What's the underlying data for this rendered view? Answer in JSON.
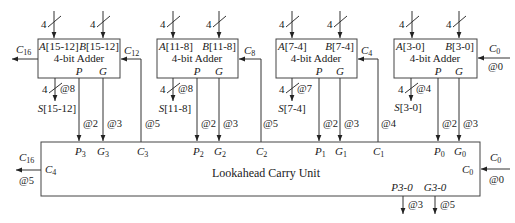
{
  "adders": [
    {
      "a": "A",
      "a_bits": "[15-12]",
      "b": "B",
      "b_bits": "[15-12]",
      "a_width": "4",
      "b_width": "4",
      "title": "4-bit Adder",
      "p": "P",
      "g": "G",
      "sum": "S",
      "sum_bits": "[15-12]",
      "sum_width": "4",
      "sum_delay": "@8",
      "cin": "C",
      "cin_sub": "12",
      "p_delay": "@2",
      "g_delay": "@3",
      "cin_delay": "@5",
      "cout": "C",
      "cout_sub": "16"
    },
    {
      "a": "A",
      "a_bits": "[11-8]",
      "b": "B",
      "b_bits": "[11-8]",
      "a_width": "4",
      "b_width": "4",
      "title": "4-bit Adder",
      "p": "P",
      "g": "G",
      "sum": "S",
      "sum_bits": "[11-8]",
      "sum_width": "4",
      "sum_delay": "@8",
      "cin": "C",
      "cin_sub": "8",
      "p_delay": "@2",
      "g_delay": "@3",
      "cin_delay": "@5"
    },
    {
      "a": "A",
      "a_bits": "[7-4]",
      "b": "B",
      "b_bits": "[7-4]",
      "a_width": "4",
      "b_width": "4",
      "title": "4-bit Adder",
      "p": "P",
      "g": "G",
      "sum": "S",
      "sum_bits": "[7-4]",
      "sum_width": "4",
      "sum_delay": "@7",
      "cin": "C",
      "cin_sub": "4",
      "p_delay": "@2",
      "g_delay": "@3",
      "cin_delay": "@4"
    },
    {
      "a": "A",
      "a_bits": "[3-0]",
      "b": "B",
      "b_bits": "[3-0]",
      "a_width": "4",
      "b_width": "4",
      "title": "4-bit Adder",
      "p": "P",
      "g": "G",
      "sum": "S",
      "sum_bits": "[3-0]",
      "sum_width": "4",
      "sum_delay": "@4",
      "cin": "C",
      "cin_sub": "0",
      "p_delay": "@2",
      "g_delay": "@3",
      "cin_delay": "@0"
    }
  ],
  "lookahead": {
    "title": "Lookahead Carry Unit",
    "ports": [
      {
        "p": "P",
        "p_sub": "3",
        "g": "G",
        "g_sub": "3",
        "c": "C",
        "c_sub": "3"
      },
      {
        "p": "P",
        "p_sub": "2",
        "g": "G",
        "g_sub": "2",
        "c": "C",
        "c_sub": "2"
      },
      {
        "p": "P",
        "p_sub": "1",
        "g": "G",
        "g_sub": "1",
        "c": "C",
        "c_sub": "1"
      },
      {
        "p": "P",
        "p_sub": "0",
        "g": "G",
        "g_sub": "0"
      }
    ],
    "carry_out_port": {
      "name": "C",
      "sub": "4"
    },
    "carry_in_port": {
      "name": "C",
      "sub": "0"
    },
    "carry_out_ext": {
      "name": "C",
      "sub": "16",
      "delay": "@5"
    },
    "carry_in_ext": {
      "name": "C",
      "sub": "0",
      "delay": "@0"
    },
    "outputs": [
      {
        "label": "P3-0",
        "delay": "@3"
      },
      {
        "label": "G3-0",
        "delay": "@5"
      }
    ]
  }
}
